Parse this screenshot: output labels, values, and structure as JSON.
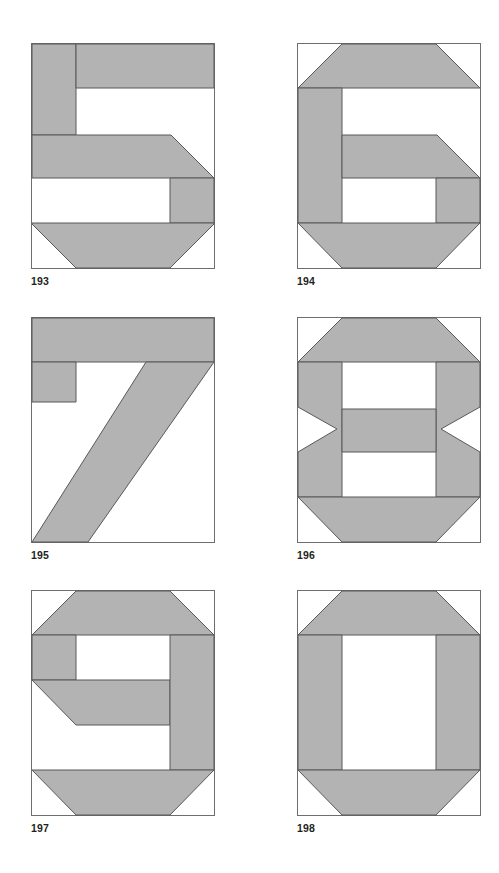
{
  "page": {
    "background_color": "#ffffff",
    "columns": 2,
    "rows": 3,
    "block_width_px": 184,
    "block_height_px": 226
  },
  "style": {
    "fill_color": "#b3b3b3",
    "outline_color": "#58595b",
    "frame_color": "#6d6e71",
    "background_color": "#ffffff",
    "caption_color": "#231f20",
    "stroke_width_px": 1
  },
  "blocks": [
    {
      "number": "193",
      "digit": "5",
      "name": "block-193-five",
      "column": 0,
      "row": 0,
      "description": "Numeral five pieced block: top bar, left vertical, diagonal mid-bar with corner wedge, right vertical, bottom bar with two bottom corner wedges"
    },
    {
      "number": "194",
      "digit": "6",
      "name": "block-194-six",
      "column": 1,
      "row": 0,
      "description": "Numeral six pieced block: chamfered top bar, full-height left vertical, diagonal mid-bar, lower-right vertical, chamfered bottom bar"
    },
    {
      "number": "195",
      "digit": "7",
      "name": "block-195-seven",
      "column": 0,
      "row": 1,
      "description": "Numeral seven pieced block: full-width top bar, short left stub, long diagonal stroke running to bottom-left"
    },
    {
      "number": "196",
      "digit": "8",
      "name": "block-196-eight",
      "column": 1,
      "row": 1,
      "description": "Numeral eight pieced block: chamfered top and bottom bars, two full verticals notched with triangles, central horizontal bar"
    },
    {
      "number": "197",
      "digit": "9",
      "name": "block-197-nine",
      "column": 0,
      "row": 2,
      "description": "Numeral nine pieced block: chamfered top bar, upper-left vertical, diagonal mid-bar, full-height right vertical, chamfered bottom bar"
    },
    {
      "number": "198",
      "digit": "0",
      "name": "block-198-zero",
      "column": 1,
      "row": 2,
      "description": "Numeral zero pieced block: chamfered top and bottom bars with two full verticals forming an open ring"
    }
  ]
}
